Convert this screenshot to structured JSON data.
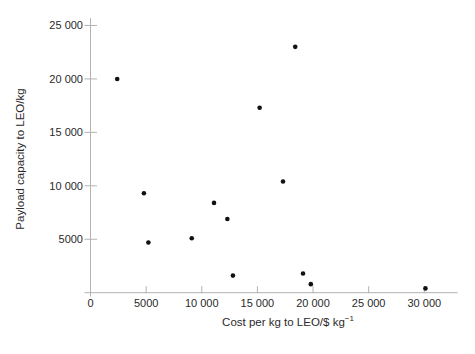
{
  "figure": {
    "background": "#ffffff",
    "axis_color": "#b2b2b2",
    "text_color": "#2a2a2a",
    "point_color": "#111111"
  },
  "chart_data": {
    "type": "scatter",
    "title": "",
    "xlabel": "Cost per kg to LEO/$ kg⁻¹",
    "xlabel_base": "Cost per kg to LEO/$ kg",
    "xlabel_sup": "−1",
    "ylabel": "Payload capacity to LEO/kg",
    "xlim": [
      0,
      33000
    ],
    "ylim": [
      0,
      25700
    ],
    "grid": false,
    "legend": "none",
    "x_ticks": [
      {
        "value": 0,
        "label": "0"
      },
      {
        "value": 5000,
        "label": "5000"
      },
      {
        "value": 10000,
        "label": "10 000"
      },
      {
        "value": 15000,
        "label": "15 000"
      },
      {
        "value": 20000,
        "label": "20 000"
      },
      {
        "value": 25000,
        "label": "25 000"
      },
      {
        "value": 30000,
        "label": "30 000"
      }
    ],
    "y_ticks": [
      {
        "value": 5000,
        "label": "5000"
      },
      {
        "value": 10000,
        "label": "10 000"
      },
      {
        "value": 15000,
        "label": "15 000"
      },
      {
        "value": 20000,
        "label": "20 000"
      },
      {
        "value": 25000,
        "label": "25 000"
      }
    ],
    "points": [
      {
        "x": 2400,
        "y": 20000
      },
      {
        "x": 4800,
        "y": 9300
      },
      {
        "x": 5200,
        "y": 4700
      },
      {
        "x": 9100,
        "y": 5100
      },
      {
        "x": 11100,
        "y": 8400
      },
      {
        "x": 12300,
        "y": 6900
      },
      {
        "x": 12800,
        "y": 1600
      },
      {
        "x": 15200,
        "y": 17300
      },
      {
        "x": 17300,
        "y": 10400
      },
      {
        "x": 18400,
        "y": 23000
      },
      {
        "x": 19100,
        "y": 1800
      },
      {
        "x": 19800,
        "y": 800
      },
      {
        "x": 30100,
        "y": 400
      }
    ]
  }
}
